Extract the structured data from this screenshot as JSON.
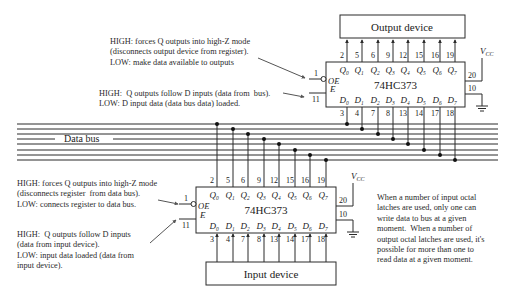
{
  "output_device": {
    "label": "Output device"
  },
  "input_device": {
    "label": "Input device"
  },
  "data_bus": {
    "label": "Data bus",
    "line_count": 8
  },
  "top_latch": {
    "part": "74HC373",
    "q_labels": [
      "Q0",
      "Q1",
      "Q2",
      "Q3",
      "Q4",
      "Q5",
      "Q6",
      "Q7"
    ],
    "q_pins": [
      "2",
      "5",
      "6",
      "9",
      "12",
      "15",
      "16",
      "19"
    ],
    "d_labels": [
      "D0",
      "D1",
      "D2",
      "D3",
      "D4",
      "D5",
      "D6",
      "D7"
    ],
    "d_pins": [
      "3",
      "4",
      "7",
      "8",
      "13",
      "14",
      "17",
      "18"
    ],
    "oe_label": "OE",
    "oe_pin": "1",
    "e_label": "E",
    "e_pin": "11",
    "vcc_label": "VCC",
    "vcc_pin": "20",
    "gnd_pin": "10"
  },
  "bottom_latch": {
    "part": "74HC373",
    "q_labels": [
      "Q0",
      "Q1",
      "Q2",
      "Q3",
      "Q4",
      "Q5",
      "Q6",
      "Q7"
    ],
    "q_pins": [
      "2",
      "5",
      "6",
      "9",
      "12",
      "15",
      "16",
      "19"
    ],
    "d_labels": [
      "D0",
      "D1",
      "D2",
      "D3",
      "D4",
      "D5",
      "D6",
      "D7"
    ],
    "d_pins": [
      "3",
      "4",
      "7",
      "8",
      "13",
      "14",
      "17",
      "18"
    ],
    "oe_label": "OE",
    "oe_pin": "1",
    "e_label": "E",
    "e_pin": "11",
    "vcc_label": "VCC",
    "vcc_pin": "20",
    "gnd_pin": "10"
  },
  "notes": {
    "top_oe": "HIGH: forces Q outputs into high-Z mode\n(disconnects output device from register).\nLOW: make data available to outputs",
    "top_e": "HIGH:  Q outputs follow D inputs (data from  bus).\nLOW: D input data (data bus data) loaded.",
    "bottom_oe": "HIGH: forces Q outputs into high-Z mode\n(disconnects register  from data bus).\nLOW: connects register to data bus.",
    "bottom_e": "HIGH:  Q outputs follow D inputs\n(data from input device).\nLOW: input data loaded (data from\ninput device).",
    "side": "When a number of input octal\nlatches are used, only one can\nwrite data to bus at a given\nmoment.  When a number of\noutput octal latches are used, it's\npossible for more than one to\nread data at a given moment."
  },
  "colors": {
    "line": "#2b2b2b",
    "text": "#222222",
    "background": "#ffffff"
  }
}
